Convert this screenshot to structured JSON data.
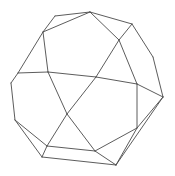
{
  "diagram": {
    "title": "",
    "type": "polyhedron-wireframe",
    "background": "#ffffff",
    "stroke_color": "#4a4a4a",
    "vertices": {
      "A": [
        55,
        16
      ],
      "B": [
        90,
        12
      ],
      "C": [
        43,
        32
      ],
      "D": [
        132,
        24
      ],
      "E": [
        119,
        40
      ],
      "F": [
        153,
        57
      ],
      "G": [
        18,
        73
      ],
      "H": [
        48,
        72
      ],
      "I": [
        96,
        77
      ],
      "J": [
        137,
        84
      ],
      "K": [
        163,
        97
      ],
      "L": [
        11,
        83
      ],
      "M": [
        15,
        120
      ],
      "N": [
        67,
        114
      ],
      "O": [
        137,
        128
      ],
      "P": [
        47,
        146
      ],
      "Q": [
        95,
        151
      ],
      "R": [
        42,
        157
      ],
      "S": [
        116,
        165
      ]
    },
    "edges": [
      [
        "A",
        "B"
      ],
      [
        "A",
        "C"
      ],
      [
        "B",
        "C"
      ],
      [
        "B",
        "D"
      ],
      [
        "B",
        "E"
      ],
      [
        "D",
        "E"
      ],
      [
        "D",
        "F"
      ],
      [
        "F",
        "K"
      ],
      [
        "E",
        "J"
      ],
      [
        "E",
        "I"
      ],
      [
        "C",
        "G"
      ],
      [
        "C",
        "H"
      ],
      [
        "G",
        "H"
      ],
      [
        "G",
        "L"
      ],
      [
        "L",
        "M"
      ],
      [
        "H",
        "I"
      ],
      [
        "I",
        "J"
      ],
      [
        "J",
        "K"
      ],
      [
        "H",
        "N"
      ],
      [
        "I",
        "N"
      ],
      [
        "N",
        "P"
      ],
      [
        "N",
        "Q"
      ],
      [
        "J",
        "O"
      ],
      [
        "O",
        "Q"
      ],
      [
        "O",
        "K"
      ],
      [
        "O",
        "S"
      ],
      [
        "K",
        "S"
      ],
      [
        "Q",
        "S"
      ],
      [
        "P",
        "Q"
      ],
      [
        "P",
        "R"
      ],
      [
        "R",
        "S"
      ],
      [
        "M",
        "P"
      ],
      [
        "M",
        "R"
      ]
    ]
  }
}
